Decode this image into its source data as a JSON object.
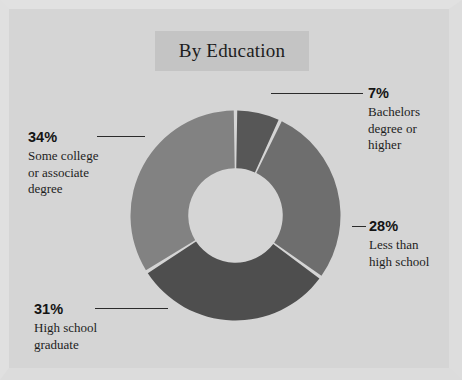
{
  "page": {
    "background_color": "#d5d5d5",
    "frame_color": "#e0e0e0"
  },
  "title": {
    "text": "By Education",
    "band_color": "#c4c4c4"
  },
  "callouts": {
    "bachelors": {
      "pct": "7%",
      "desc": "Bachelors\ndegree or\nhigher"
    },
    "lessthan": {
      "pct": "28%",
      "desc": "Less than\nhigh school"
    },
    "somecollege": {
      "pct": "34%",
      "desc": "Some college\nor associate\ndegree"
    },
    "highschool": {
      "pct": "31%",
      "desc": "High school\ngraduate"
    }
  },
  "chart_data": {
    "type": "pie",
    "variant": "donut",
    "title": "By Education",
    "xlabel": "",
    "ylabel": "",
    "units": "percent",
    "total": 100,
    "start_angle_deg": 0,
    "direction": "clockwise",
    "inner_radius_ratio": 0.45,
    "gap_color": "#d5d5d5",
    "legend_position": "callout-labels",
    "grid": false,
    "categories": [
      "Bachelors degree or higher",
      "Less than high school",
      "High school graduate",
      "Some college or associate degree"
    ],
    "values": [
      7,
      28,
      31,
      34
    ],
    "labels": [
      "7%",
      "28%",
      "31%",
      "34%"
    ],
    "colors": [
      "#575757",
      "#6e6e6e",
      "#4e4e4e",
      "#828282"
    ],
    "slices": [
      {
        "label": "Bachelors degree or higher",
        "value": 7,
        "display": "7%",
        "color": "#575757"
      },
      {
        "label": "Less than high school",
        "value": 28,
        "display": "28%",
        "color": "#6e6e6e"
      },
      {
        "label": "High school graduate",
        "value": 31,
        "display": "31%",
        "color": "#4e4e4e"
      },
      {
        "label": "Some college or associate degree",
        "value": 34,
        "display": "34%",
        "color": "#828282"
      }
    ]
  }
}
